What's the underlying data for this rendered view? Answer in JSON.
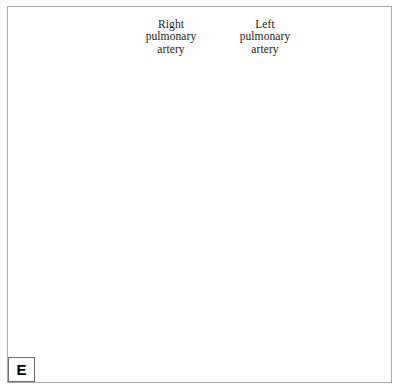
{
  "figure": {
    "panel_letter": "E",
    "caption_visible": false,
    "background_color": "#ffffff",
    "frame_color": "#a9a9a9",
    "ink_color": "#111111",
    "vessel_fill": "#c9c9c9",
    "vessel_fill_light": "#d6d6d6",
    "organ_fill": "#c2c2c2",
    "hatch_color": "#5a5a5a"
  },
  "labels": {
    "right_pulmonary_artery": "Right\npulmonary\nartery",
    "left_pulmonary_artery": "Left\npulmonary\nartery"
  },
  "annotations": {
    "leader_right": "leader-line-right-pulmonary-artery",
    "leader_left": "leader-line-left-pulmonary-artery"
  },
  "panels": [
    {
      "name": "upper-panel",
      "description": "Pulmonary artery bifurcation with occlusion device and catheter at right pulmonary artery, two transected vessel stumps and shaded cardiac mass below",
      "elements": [
        "pulmonary-trunk",
        "right-pulmonary-artery",
        "left-pulmonary-artery",
        "occlusion-device",
        "catheter-tube",
        "vessel-stump-anterior",
        "vessel-stump-posterior",
        "cardiac-mass",
        "hatch-shading-patch-upper",
        "hatch-shading-patch-lower"
      ]
    },
    {
      "name": "lower-panel",
      "description": "Same pulmonary artery tree after deployment showing coiled embolization device in right pulmonary artery",
      "elements": [
        "pulmonary-trunk",
        "right-pulmonary-artery",
        "left-pulmonary-artery",
        "embolization-coil-spiral",
        "residual-catheter-line",
        "cardiac-mass"
      ]
    }
  ],
  "icons": {
    "coil": "spiral-coil-icon",
    "device": "cylindrical-occluder-icon"
  }
}
